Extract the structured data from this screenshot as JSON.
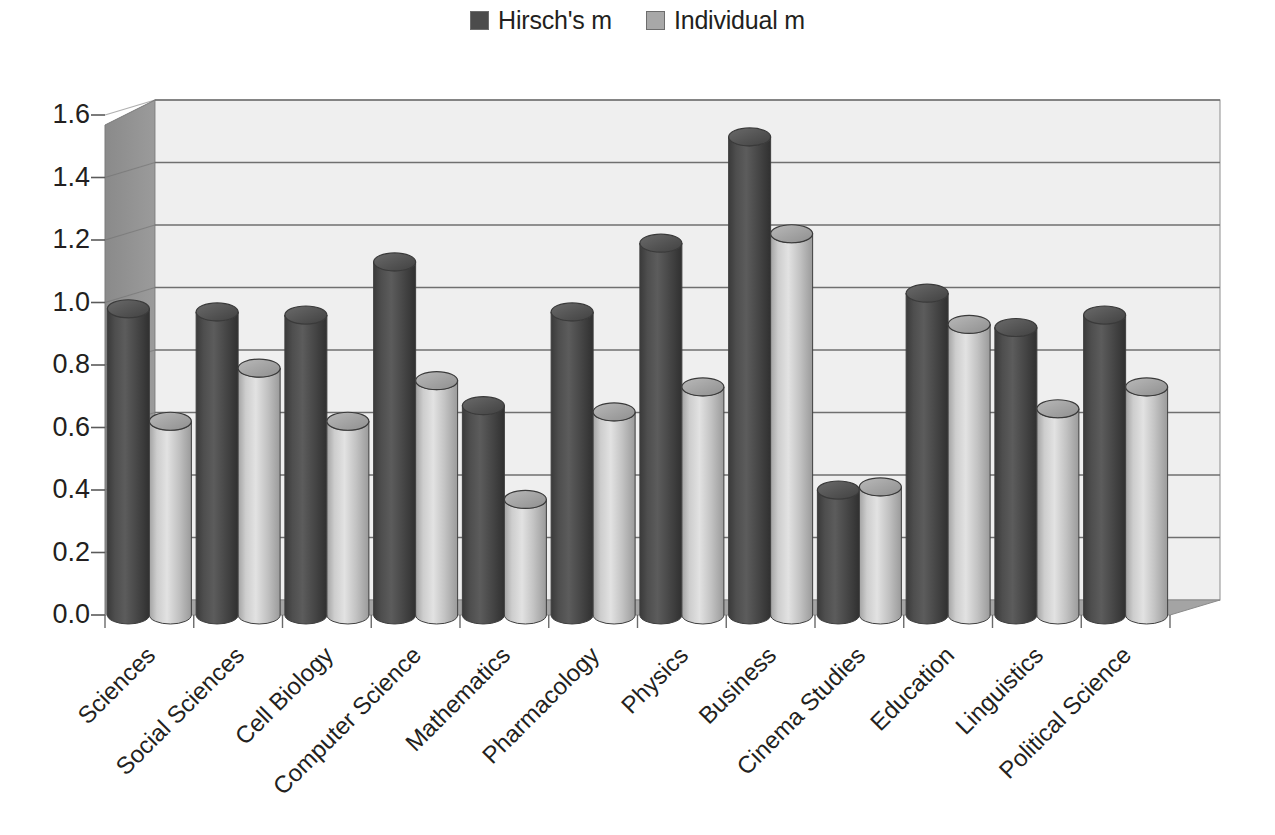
{
  "legend": {
    "position": "top-center",
    "entries": [
      {
        "label": "Hirsch's m",
        "color": "#4c4c4c",
        "swatch_name": "legend-swatch-hirsch"
      },
      {
        "label": "Individual m",
        "color": "#a8a8a8",
        "swatch_name": "legend-swatch-individual"
      }
    ]
  },
  "colors": {
    "series_dark": "#4c4c4c",
    "series_light": "#bdbdbd",
    "plot_background": "#efefef",
    "side_wall": "#8c8c8c",
    "floor": "#a0a0a0",
    "gridline": "#6f6f6f",
    "text": "#231f20"
  },
  "chart_data": {
    "type": "bar",
    "title": "",
    "xlabel": "",
    "ylabel": "",
    "ylim": [
      0.0,
      1.6
    ],
    "yticks": [
      "0.0",
      "0.2",
      "0.4",
      "0.6",
      "0.8",
      "1.0",
      "1.2",
      "1.4",
      "1.6"
    ],
    "ytick_values": [
      0.0,
      0.2,
      0.4,
      0.6,
      0.8,
      1.0,
      1.2,
      1.4,
      1.6
    ],
    "grid": "horizontal",
    "style": "3d-cylinder",
    "categories": [
      "Sciences",
      "Social Sciences",
      "Cell Biology",
      "Computer Science",
      "Mathematics",
      "Pharmacology",
      "Physics",
      "Business",
      "Cinema Studies",
      "Education",
      "Linguistics",
      "Political Science"
    ],
    "series": [
      {
        "name": "Hirsch's m",
        "color": "#4c4c4c",
        "values": [
          0.98,
          0.97,
          0.96,
          1.13,
          0.67,
          0.97,
          1.19,
          1.53,
          0.4,
          1.03,
          0.92,
          0.96
        ]
      },
      {
        "name": "Individual m",
        "color": "#bdbdbd",
        "values": [
          0.62,
          0.79,
          0.62,
          0.75,
          0.37,
          0.65,
          0.73,
          1.22,
          0.41,
          0.93,
          0.66,
          0.73
        ]
      }
    ]
  }
}
